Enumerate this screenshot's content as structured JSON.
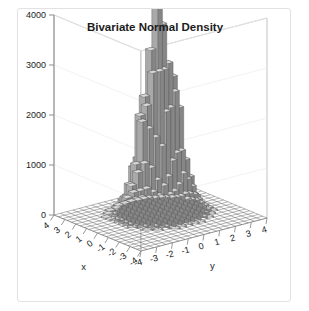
{
  "figure": {
    "title": "Bivariate Normal Density",
    "zlabel": "z",
    "xlabel": "x",
    "ylabel": "y"
  },
  "chart_data": {
    "type": "bar",
    "title": "Bivariate Normal Density",
    "subtitle": "",
    "render": "3d-histogram",
    "xlabel": "x",
    "ylabel": "y",
    "zlabel": "z",
    "xlim": [
      -4,
      4
    ],
    "ylim": [
      -4,
      4
    ],
    "zlim": [
      0,
      4000
    ],
    "grid": true,
    "legend": null,
    "xticks": [
      -4,
      -3,
      -2,
      -1,
      0,
      1,
      2,
      3,
      4
    ],
    "yticks": [
      -4,
      -3,
      -2,
      -1,
      0,
      1,
      2,
      3,
      4
    ],
    "zticks": [
      0,
      1000,
      2000,
      3000,
      4000
    ],
    "xticklabels": [
      "-4",
      "-3",
      "-2",
      "-1",
      "0",
      "1",
      "2",
      "3",
      "4"
    ],
    "yticklabels": [
      "-4",
      "-3",
      "-2",
      "-1",
      "0",
      "1",
      "2",
      "3",
      "4"
    ],
    "zticklabels": [
      "0",
      "1000",
      "2000",
      "3000",
      "4000"
    ],
    "distribution": {
      "name": "bivariate-normal",
      "mean_x": 0.35,
      "mean_y": 0.2,
      "sigma_x": 0.85,
      "sigma_y": 0.85,
      "rho": 0.0,
      "peak_value": 3780,
      "bins_x": 20,
      "bins_y": 20,
      "noise_amplitude": 0.16
    },
    "view": {
      "azimuth_deg": -45,
      "elevation_deg": 22
    }
  },
  "colors": {
    "bar_top": "#d9d9d9",
    "bar_front": "#a9a9a9",
    "bar_side": "#868686",
    "bar_edge": "#4d4d4d",
    "grid_line": "#5c5c5c",
    "wall_line": "#b4b4b4",
    "axis_line": "#8d8d8d",
    "text": "#1c1c1c",
    "frame_border": "#e2e2e4",
    "background": "#ffffff"
  }
}
